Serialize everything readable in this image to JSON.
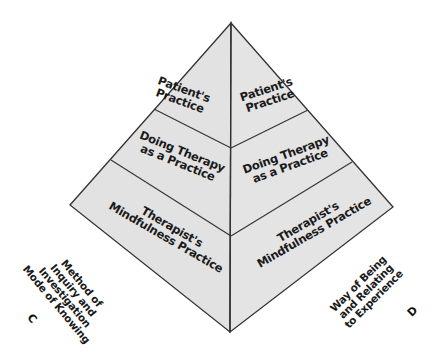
{
  "diagram": {
    "type": "pyramid",
    "colors": {
      "face_fill": "#e2e2e2",
      "edge": "#333333",
      "text": "#1a1a1a",
      "background": "#ffffff"
    },
    "left_face": {
      "levels": [
        {
          "line1": "Patient's",
          "line2": "Practice"
        },
        {
          "line1": "Doing Therapy",
          "line2": "as a Practice"
        },
        {
          "line1": "Therapist's",
          "line2": "Mindfulness Practice"
        }
      ]
    },
    "right_face": {
      "levels": [
        {
          "line1": "Patient's",
          "line2": "Practice"
        },
        {
          "line1": "Doing Therapy",
          "line2": "as a Practice"
        },
        {
          "line1": "Therapist's",
          "line2": "Mindfulness Practice"
        }
      ]
    },
    "axis_c": {
      "lines": [
        "Method of",
        "Inquiry and",
        "Investigation",
        "Mode of Knowing"
      ],
      "letter": "C"
    },
    "axis_d": {
      "lines": [
        "Way of Being",
        "and Relating",
        "to Experience"
      ],
      "letter": "D"
    }
  }
}
